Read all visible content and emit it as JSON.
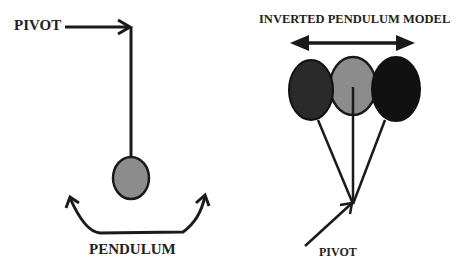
{
  "left_diagram": {
    "pivot_label": "PIVOT",
    "pendulum_label": "PENDULUM",
    "bob_color": "#8c8c8c"
  },
  "right_diagram": {
    "title": "INVERTED PENDULUM MODEL",
    "pivot_label": "PIVOT",
    "bob_colors": [
      "#2a2a2a",
      "#8c8c8c",
      "#111111"
    ]
  },
  "colors": {
    "stroke": "#1a1a1a",
    "text": "#222222",
    "background": "#ffffff"
  }
}
